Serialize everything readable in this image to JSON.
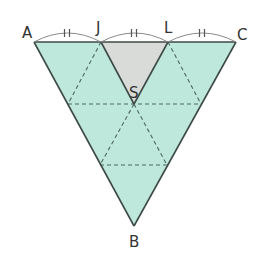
{
  "figure": {
    "type": "geometry",
    "colors": {
      "fill": "#bfe8dc",
      "shaded": "#d9dbd9",
      "stroke": "#3d4a46",
      "dash": "#4f6660",
      "arc": "#7a7a7a",
      "label": "#333333"
    },
    "points": {
      "A": {
        "label": "A",
        "x": 34,
        "y": 42
      },
      "J": {
        "label": "J",
        "x": 101,
        "y": 42
      },
      "L": {
        "label": "L",
        "x": 168,
        "y": 42
      },
      "C": {
        "label": "C",
        "x": 236,
        "y": 42
      },
      "S": {
        "label": "S",
        "x": 134,
        "y": 104
      },
      "B": {
        "label": "B",
        "x": 134,
        "y": 226
      }
    },
    "labels": {
      "A": "A",
      "J": "J",
      "L": "L",
      "C": "C",
      "S": "S",
      "B": "B"
    },
    "tick_marks": [
      "AJ",
      "JL",
      "LC"
    ],
    "equal_segment_mark": "||"
  }
}
